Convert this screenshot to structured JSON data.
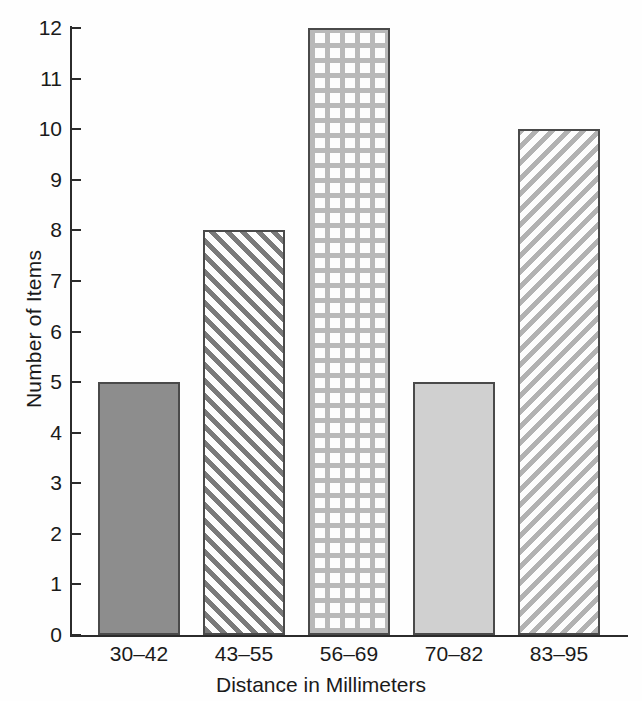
{
  "chart_data": {
    "type": "bar",
    "title": "",
    "xlabel": "Distance in Millimeters",
    "ylabel": "Number of Items",
    "categories": [
      "30–42",
      "43–55",
      "56–69",
      "70–82",
      "83–95"
    ],
    "values": [
      5,
      8,
      12,
      5,
      10
    ],
    "ylim": [
      0,
      12
    ],
    "yticks": [
      "0",
      "1",
      "2",
      "3",
      "4",
      "5",
      "6",
      "7",
      "8",
      "9",
      "10",
      "11",
      "12"
    ],
    "grid": false,
    "legend": null,
    "orientation": "vertical",
    "bar_styles": [
      {
        "fill": "solid-dark",
        "color": "#8d8d8d"
      },
      {
        "fill": "diagonal-stripes-dark",
        "color": "#7a7a7a"
      },
      {
        "fill": "grid-crosshatch-light",
        "color": "#b9b9b9"
      },
      {
        "fill": "solid-light",
        "color": "#d0d0d0"
      },
      {
        "fill": "diagonal-stripes-light",
        "color": "#b2b2b2"
      }
    ],
    "axis_color": "#2b2b2b",
    "background": "#fefefe"
  }
}
